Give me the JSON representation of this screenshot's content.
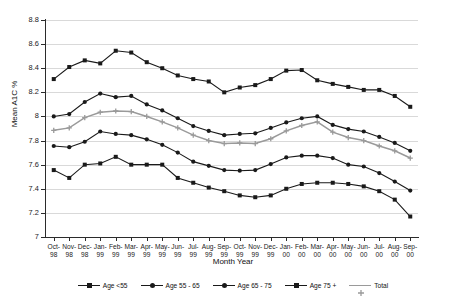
{
  "chart_data": {
    "type": "line",
    "title": "",
    "xlabel": "Month Year",
    "ylabel": "Mean A1C %",
    "ylim": [
      7,
      8.8
    ],
    "ytick_step": 0.2,
    "grid": true,
    "legend_position": "bottom",
    "categories": [
      "Oct-98",
      "Nov-98",
      "Dec-98",
      "Jan-99",
      "Feb-99",
      "Mar-99",
      "Apr-99",
      "May-99",
      "Jun-99",
      "Jul-99",
      "Aug-99",
      "Sep-99",
      "Oct-99",
      "Nov-99",
      "Dec-99",
      "Jan-00",
      "Feb-00",
      "Mar-00",
      "Apr-00",
      "May-00",
      "Jun-00",
      "Jul-00",
      "Aug-00",
      "Sep-00"
    ],
    "category_lines": [
      [
        "Oct-",
        "98"
      ],
      [
        "Nov-",
        "98"
      ],
      [
        "Dec-",
        "98"
      ],
      [
        "Jan-",
        "99"
      ],
      [
        "Feb-",
        "99"
      ],
      [
        "Mar-",
        "99"
      ],
      [
        "Apr-",
        "99"
      ],
      [
        "May-",
        "99"
      ],
      [
        "Jun-",
        "99"
      ],
      [
        "Jul-",
        "99"
      ],
      [
        "Aug-",
        "99"
      ],
      [
        "Sep-",
        "99"
      ],
      [
        "Oct-",
        "99"
      ],
      [
        "Nov-",
        "99"
      ],
      [
        "Dec-",
        "99"
      ],
      [
        "Jan-",
        "00"
      ],
      [
        "Feb-",
        "00"
      ],
      [
        "Mar-",
        "00"
      ],
      [
        "Apr-",
        "00"
      ],
      [
        "May-",
        "00"
      ],
      [
        "Jun-",
        "00"
      ],
      [
        "Jul-",
        "00"
      ],
      [
        "Aug-",
        "00"
      ],
      [
        "Sep-",
        "00"
      ]
    ],
    "ytick_labels": [
      "7",
      "7.2",
      "7.4",
      "7.6",
      "7.8",
      "8",
      "8.2",
      "8.4",
      "8.6",
      "8.8"
    ],
    "ytick_values": [
      7,
      7.2,
      7.4,
      7.6,
      7.8,
      8,
      8.2,
      8.4,
      8.6,
      8.8
    ],
    "series": [
      {
        "name": "Age <55",
        "color": "#1a1a1a",
        "marker": "square",
        "values": [
          7.555,
          7.49,
          7.6,
          7.61,
          7.665,
          7.6,
          7.6,
          7.6,
          7.49,
          7.45,
          7.41,
          7.38,
          7.345,
          7.33,
          7.345,
          7.4,
          7.44,
          7.45,
          7.45,
          7.44,
          7.42,
          7.38,
          7.31,
          7.17
        ]
      },
      {
        "name": "Age 55 - 65",
        "color": "#1a1a1a",
        "marker": "circle",
        "values": [
          7.755,
          7.745,
          7.79,
          7.875,
          7.855,
          7.845,
          7.81,
          7.765,
          7.7,
          7.625,
          7.59,
          7.555,
          7.55,
          7.555,
          7.605,
          7.66,
          7.675,
          7.675,
          7.655,
          7.6,
          7.585,
          7.53,
          7.46,
          7.385
        ]
      },
      {
        "name": "Total",
        "color": "#9a9a9a",
        "marker": "cross",
        "values": [
          7.885,
          7.905,
          7.99,
          8.035,
          8.045,
          8.04,
          8.0,
          7.955,
          7.905,
          7.845,
          7.8,
          7.775,
          7.78,
          7.775,
          7.815,
          7.88,
          7.925,
          7.955,
          7.87,
          7.825,
          7.8,
          7.755,
          7.715,
          7.655
        ]
      },
      {
        "name": "Age 65 - 75",
        "color": "#1a1a1a",
        "marker": "circle",
        "values": [
          8.0,
          8.02,
          8.12,
          8.19,
          8.16,
          8.17,
          8.1,
          8.05,
          7.985,
          7.92,
          7.88,
          7.845,
          7.855,
          7.86,
          7.905,
          7.95,
          7.985,
          8.0,
          7.93,
          7.895,
          7.875,
          7.83,
          7.78,
          7.715
        ]
      },
      {
        "name": "Age 75 +",
        "color": "#1a1a1a",
        "marker": "square",
        "values": [
          8.31,
          8.41,
          8.465,
          8.44,
          8.545,
          8.53,
          8.45,
          8.4,
          8.34,
          8.31,
          8.29,
          8.2,
          8.24,
          8.26,
          8.31,
          8.38,
          8.385,
          8.3,
          8.27,
          8.245,
          8.22,
          8.22,
          8.17,
          8.08
        ]
      }
    ],
    "legend": [
      {
        "label": "Age <55",
        "color": "#1a1a1a",
        "marker": "square"
      },
      {
        "label": "Age 55 - 65",
        "color": "#1a1a1a",
        "marker": "circle"
      },
      {
        "label": "Age 65 - 75",
        "color": "#1a1a1a",
        "marker": "circle"
      },
      {
        "label": "Age 75 +",
        "color": "#1a1a1a",
        "marker": "square"
      },
      {
        "label": "Total",
        "color": "#9a9a9a",
        "marker": "cross"
      }
    ]
  }
}
